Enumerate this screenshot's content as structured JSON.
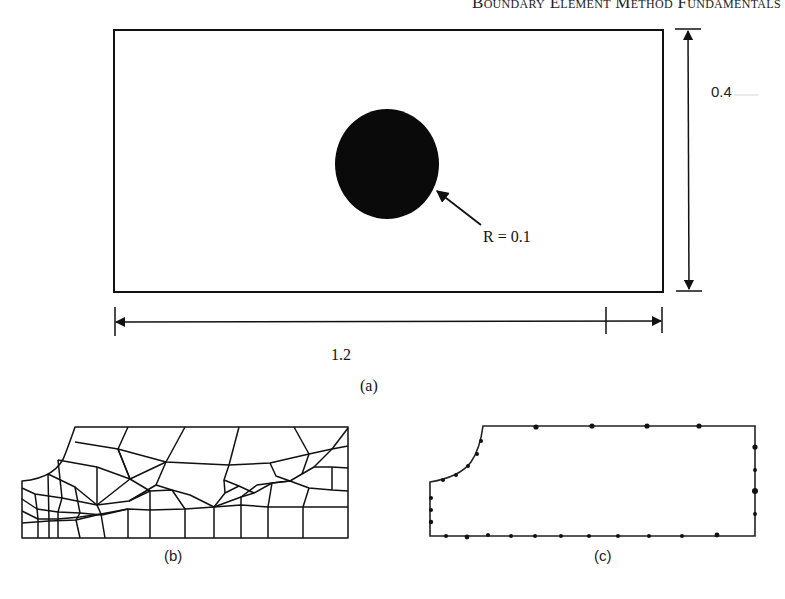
{
  "header": {
    "running_title": "Boundary Element Method Fundamentals"
  },
  "figure_a": {
    "caption": "(a)",
    "plate": {
      "width_label": "1.2",
      "height_label": "0.4"
    },
    "hole": {
      "radius_label": "R = 0.1"
    }
  },
  "figure_b": {
    "caption": "(b)",
    "description": "finite element mesh of quarter plate with hole"
  },
  "figure_c": {
    "caption": "(c)",
    "description": "boundary element discretization of quarter plate with hole"
  },
  "colors": {
    "ink": "#111111",
    "background": "#ffffff"
  }
}
